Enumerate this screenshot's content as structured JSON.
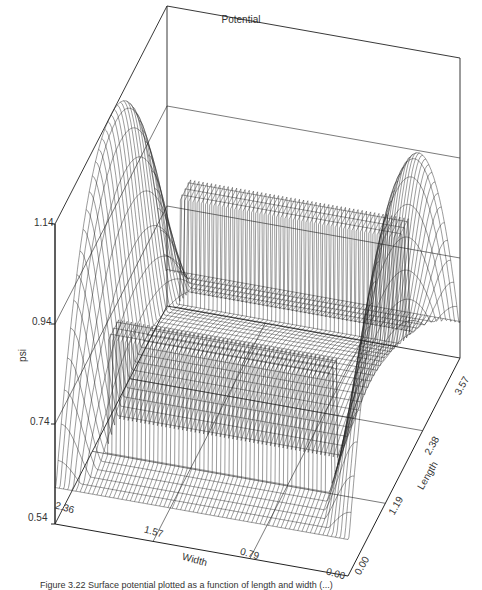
{
  "chart_data": {
    "type": "surface3d",
    "title": "Potential",
    "xlabel": "Width",
    "ylabel": "Length",
    "zlabel": "psi",
    "x_ticks": [
      "0.00",
      "0.79",
      "1.57",
      "2.36"
    ],
    "y_ticks": [
      "0.00",
      "1.19",
      "2.38",
      "3.57"
    ],
    "z_ticks": [
      "0.54",
      "0.74",
      "0.94",
      "1.14"
    ],
    "x_range": [
      0.0,
      2.36
    ],
    "y_range": [
      0.0,
      3.57
    ],
    "z_range": [
      0.54,
      1.14
    ],
    "grid": true,
    "render": "wireframe mesh"
  },
  "labels": {
    "title": "Potential",
    "z_axis": "psi",
    "x_axis": "Width",
    "y_axis": "Length",
    "z_ticks": [
      "1.14",
      "0.94",
      "0.74",
      "0.54"
    ],
    "x_ticks": [
      "2.36",
      "1.57",
      "0.79",
      "0.00"
    ],
    "y_ticks": [
      "0.00",
      "1.19",
      "2.38",
      "3.57"
    ]
  },
  "caption": "Figure 3.22   Surface potential plotted as a function of length and width (...)"
}
